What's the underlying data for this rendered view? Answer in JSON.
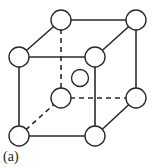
{
  "figure": {
    "label": "(a)",
    "line_color": "#2a2a2a",
    "atom_fill": "#ffffff",
    "atom_stroke": "#2a2a2a"
  },
  "atoms": [
    {
      "name": "front-bottom-left",
      "x": 19,
      "y": 136
    },
    {
      "name": "front-bottom-right",
      "x": 95,
      "y": 136
    },
    {
      "name": "front-top-left",
      "x": 19,
      "y": 57
    },
    {
      "name": "front-top-right",
      "x": 95,
      "y": 57
    },
    {
      "name": "back-bottom-left",
      "x": 61,
      "y": 98
    },
    {
      "name": "back-bottom-right",
      "x": 136,
      "y": 98
    },
    {
      "name": "back-top-left",
      "x": 61,
      "y": 20
    },
    {
      "name": "back-top-right",
      "x": 136,
      "y": 20
    },
    {
      "name": "body-center",
      "x": 80,
      "y": 78
    }
  ]
}
